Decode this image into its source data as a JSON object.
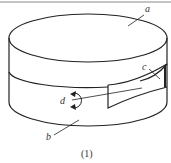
{
  "figure": {
    "caption": "(1)",
    "labels": {
      "a": "a",
      "b": "b",
      "c": "c",
      "d": "d"
    },
    "stroke_color": "#222222"
  }
}
